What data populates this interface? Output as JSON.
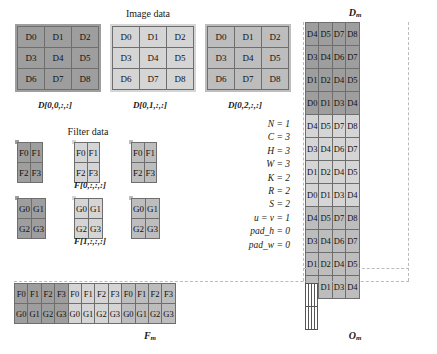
{
  "figure": {
    "image_data_heading": "Image data",
    "filter_data_heading": "Filter data",
    "dm_heading": "D",
    "dm_heading_sub": "m",
    "fm_heading": "F",
    "fm_heading_sub": "m",
    "om_heading": "O",
    "om_heading_sub": "m"
  },
  "image_data": {
    "blocks": [
      {
        "caption": "D[0,0,:,:]",
        "tone": "dark",
        "rows": [
          [
            "D0",
            "D1",
            "D2"
          ],
          [
            "D3",
            "D4",
            "D5"
          ],
          [
            "D6",
            "D7",
            "D8"
          ]
        ]
      },
      {
        "caption": "D[0,1,:,:]",
        "tone": "light",
        "rows": [
          [
            "D0",
            "D1",
            "D2"
          ],
          [
            "D3",
            "D4",
            "D5"
          ],
          [
            "D6",
            "D7",
            "D8"
          ]
        ]
      },
      {
        "caption": "D[0,2,:,:]",
        "tone": "mid",
        "rows": [
          [
            "D0",
            "D1",
            "D2"
          ],
          [
            "D3",
            "D4",
            "D5"
          ],
          [
            "D6",
            "D7",
            "D8"
          ]
        ]
      }
    ]
  },
  "filter_data": {
    "rows": [
      {
        "caption": "F[0,:,:,:]",
        "blocks": [
          {
            "tone": "dark",
            "rows": [
              [
                "F0",
                "F1"
              ],
              [
                "F2",
                "F3"
              ]
            ]
          },
          {
            "tone": "light",
            "rows": [
              [
                "F0",
                "F1"
              ],
              [
                "F2",
                "F3"
              ]
            ]
          },
          {
            "tone": "mid",
            "rows": [
              [
                "F0",
                "F1"
              ],
              [
                "F2",
                "F3"
              ]
            ]
          }
        ]
      },
      {
        "caption": "F[1,:,:,:]",
        "blocks": [
          {
            "tone": "dark",
            "rows": [
              [
                "G0",
                "G1"
              ],
              [
                "G2",
                "G3"
              ]
            ]
          },
          {
            "tone": "light",
            "rows": [
              [
                "G0",
                "G1"
              ],
              [
                "G2",
                "G3"
              ]
            ]
          },
          {
            "tone": "mid",
            "rows": [
              [
                "G0",
                "G1"
              ],
              [
                "G2",
                "G3"
              ]
            ]
          }
        ]
      }
    ]
  },
  "parameters": [
    "N = 1",
    "C = 3",
    "H = 3",
    "W = 3",
    "K = 2",
    "R = 2",
    "S = 2",
    "u = v = 1",
    "pad_h = 0",
    "pad_w = 0"
  ],
  "dm_matrix": {
    "groups": [
      {
        "tone": "dark",
        "rows": [
          [
            "D4",
            "D5",
            "D7",
            "D8"
          ],
          [
            "D3",
            "D4",
            "D6",
            "D7"
          ],
          [
            "D1",
            "D2",
            "D4",
            "D5"
          ],
          [
            "D0",
            "D1",
            "D3",
            "D4"
          ]
        ]
      },
      {
        "tone": "light",
        "rows": [
          [
            "D4",
            "D5",
            "D7",
            "D8"
          ],
          [
            "D3",
            "D4",
            "D6",
            "D7"
          ],
          [
            "D1",
            "D2",
            "D4",
            "D5"
          ],
          [
            "D0",
            "D1",
            "D3",
            "D4"
          ]
        ]
      },
      {
        "tone": "mid",
        "rows": [
          [
            "D4",
            "D5",
            "D7",
            "D8"
          ],
          [
            "D3",
            "D4",
            "D6",
            "D7"
          ],
          [
            "D1",
            "D2",
            "D4",
            "D5"
          ],
          [
            "D0",
            "D1",
            "D3",
            "D4"
          ]
        ]
      }
    ]
  },
  "fm_matrix": {
    "groups": [
      {
        "tone": "dark",
        "rows": [
          [
            "F0",
            "F1",
            "F2",
            "F3"
          ],
          [
            "G0",
            "G1",
            "G2",
            "G3"
          ]
        ]
      },
      {
        "tone": "light",
        "rows": [
          [
            "F0",
            "F1",
            "F2",
            "F3"
          ],
          [
            "G0",
            "G1",
            "G2",
            "G3"
          ]
        ]
      },
      {
        "tone": "mid",
        "rows": [
          [
            "F0",
            "F1",
            "F2",
            "F3"
          ],
          [
            "G0",
            "G1",
            "G2",
            "G3"
          ]
        ]
      }
    ]
  },
  "om_matrix": {
    "rows": 2,
    "cols": 4,
    "cells": [
      [
        "",
        "",
        "",
        ""
      ],
      [
        "",
        "",
        "",
        ""
      ]
    ]
  },
  "colors": {
    "tone_dark": "#9e9e9e",
    "tone_light": "#d5d5d5",
    "tone_mid": "#bdbdbd",
    "cell_border": "#6e6e6e",
    "background": "#ffffff",
    "text": "#111111"
  }
}
